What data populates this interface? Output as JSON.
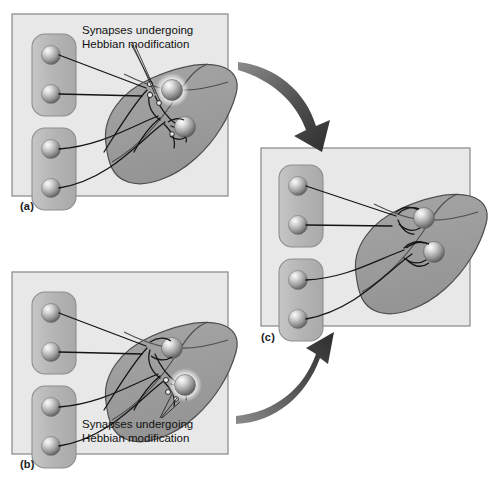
{
  "figure": {
    "background_color": "#ffffff",
    "panel_fill": "#e8e8e8",
    "panel_border": "#9a9a9a",
    "input_group_fill": "#b9b9b9",
    "input_group_border": "#8f8f8f",
    "cortex_fill": "#9d9d9d",
    "cortex_band_fill": "#b5b5b5",
    "cortex_border": "#4a4a4a",
    "axon_color": "#1a1a1a",
    "arrow_color": "#3a3a3a",
    "sphere_light": "#f2f2f2",
    "sphere_dark": "#6e6e6e",
    "glow_color": "#f5f5f5"
  },
  "panels": [
    {
      "id": "a",
      "caption": "(a)",
      "label": {
        "line1": "Synapses undergoing",
        "line2": "Hebbian modification",
        "position": "top",
        "points_to": "upper-neuron-synapses"
      },
      "input_groups": 2,
      "inputs_per_group": 2,
      "target_neurons": 2,
      "highlighted_neuron": "upper",
      "synapse_state": "weak-open"
    },
    {
      "id": "b",
      "caption": "(b)",
      "label": {
        "line1": "Synapses undergoing",
        "line2": "Hebbian modification",
        "position": "bottom",
        "points_to": "lower-neuron-synapses"
      },
      "input_groups": 2,
      "inputs_per_group": 2,
      "target_neurons": 2,
      "highlighted_neuron": "lower",
      "synapse_state": "weak-open"
    },
    {
      "id": "c",
      "caption": "(c)",
      "label": null,
      "input_groups": 2,
      "inputs_per_group": 2,
      "target_neurons": 2,
      "highlighted_neuron": "none",
      "synapse_state": "strengthened"
    }
  ],
  "arrows": [
    {
      "name": "arrow-a-to-c",
      "from_panel": "a",
      "to_panel": "c",
      "direction": "down-right"
    },
    {
      "name": "arrow-b-to-c",
      "from_panel": "b",
      "to_panel": "c",
      "direction": "up-right"
    }
  ]
}
